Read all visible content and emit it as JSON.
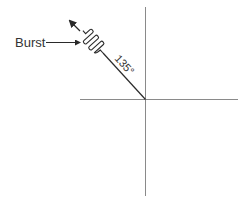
{
  "diagram": {
    "labels": {
      "burst": "Burst",
      "angle": "135°"
    },
    "angle_degrees": 135,
    "colors": {
      "axis": "#8a8a8a",
      "ink": "#2a2a2a",
      "background": "#ffffff"
    }
  }
}
